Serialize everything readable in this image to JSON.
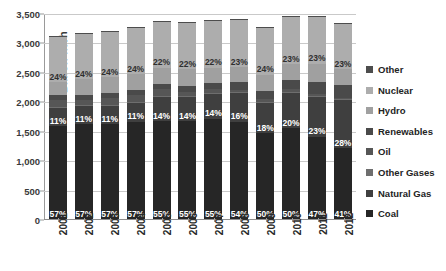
{
  "chart_data": {
    "type": "bar",
    "subtype": "stacked-bar",
    "title": "",
    "xlabel": "",
    "ylabel": "Billion kWh",
    "ylim": [
      0,
      3500
    ],
    "ytick_values": [
      0,
      500,
      1000,
      1500,
      2000,
      2500,
      3000,
      3500
    ],
    "ytick_labels": [
      "0",
      "500",
      "1,000",
      "1,500",
      "2,000",
      "2,500",
      "3,000",
      "3,500"
    ],
    "grid": true,
    "legend_position": "right",
    "categories": [
      "2001",
      "2002",
      "2003",
      "2004",
      "2005",
      "2006",
      "2007",
      "2008",
      "2009",
      "2010",
      "2011",
      "2012"
    ],
    "series": [
      {
        "name": "Coal",
        "color": "#262626",
        "values": [
          1580,
          1610,
          1610,
          1650,
          1660,
          1660,
          1700,
          1650,
          1460,
          1540,
          1400,
          1200
        ],
        "labels": [
          "57%",
          "57%",
          "57%",
          "57%",
          "55%",
          "55%",
          "55%",
          "54%",
          "50%",
          "50%",
          "47%",
          "41%"
        ]
      },
      {
        "name": "Natural Gas",
        "color": "#3f3f3f",
        "values": [
          305,
          310,
          310,
          320,
          420,
          425,
          435,
          490,
          525,
          615,
          685,
          820
        ],
        "labels": [
          "11%",
          "11%",
          "11%",
          "11%",
          "14%",
          "14%",
          "14%",
          "16%",
          "18%",
          "20%",
          "23%",
          "28%"
        ]
      },
      {
        "name": "Other Gases",
        "color": "#6e6e6e",
        "values": [
          16,
          16,
          16,
          16,
          14,
          14,
          14,
          12,
          11,
          11,
          11,
          11
        ],
        "labels": [
          "",
          "",
          "",
          "",
          "",
          "",
          "",
          "",
          "",
          "",
          "",
          ""
        ]
      },
      {
        "name": "Oil",
        "color": "#565656",
        "values": [
          125,
          95,
          120,
          120,
          122,
          64,
          65,
          46,
          38,
          37,
          30,
          23
        ],
        "labels": [
          "",
          "",
          "",
          "",
          "",
          "",
          "",
          "",
          "",
          "",
          "",
          ""
        ]
      },
      {
        "name": "Renewables",
        "color": "#4a4a4a",
        "values": [
          80,
          79,
          79,
          83,
          87,
          96,
          105,
          126,
          144,
          167,
          195,
          219
        ],
        "labels": [
          "",
          "",
          "",
          "",
          "",
          "",
          "",
          "",
          "",
          "",
          "",
          ""
        ]
      },
      {
        "name": "Hydro",
        "color": "#a0a0a0",
        "values": [
          217,
          264,
          276,
          268,
          270,
          289,
          248,
          255,
          273,
          260,
          319,
          276
        ],
        "labels": [
          "",
          "",
          "",
          "",
          "",
          "",
          "",
          "",
          "",
          "",
          "",
          ""
        ]
      },
      {
        "name": "Nuclear",
        "color": "#adadad",
        "values": [
          769,
          780,
          764,
          789,
          782,
          787,
          806,
          806,
          799,
          807,
          790,
          769
        ],
        "labels": [
          "24%",
          "24%",
          "24%",
          "24%",
          "22%",
          "22%",
          "22%",
          "23%",
          "24%",
          "23%",
          "23%",
          "23%"
        ]
      },
      {
        "name": "Other",
        "color": "#4d4d4d",
        "values": [
          12,
          12,
          12,
          12,
          12,
          12,
          12,
          12,
          12,
          12,
          12,
          12
        ],
        "labels": [
          "",
          "",
          "",
          "",
          "",
          "",
          "",
          "",
          "",
          "",
          "",
          ""
        ]
      }
    ],
    "totals": [
      2770,
      2870,
      2870,
      2940,
      3000,
      3000,
      3110,
      3050,
      2930,
      3010,
      3000,
      2940
    ]
  },
  "legend": {
    "items": [
      {
        "label": "Other",
        "color": "#4d4d4d"
      },
      {
        "label": "Nuclear",
        "color": "#adadad"
      },
      {
        "label": "Hydro",
        "color": "#a0a0a0"
      },
      {
        "label": "Renewables",
        "color": "#4a4a4a"
      },
      {
        "label": "Oil",
        "color": "#565656"
      },
      {
        "label": "Other Gases",
        "color": "#6e6e6e"
      },
      {
        "label": "Natural Gas",
        "color": "#3f3f3f"
      },
      {
        "label": "Coal",
        "color": "#262626"
      }
    ]
  },
  "axis": {
    "y_title": "Billion kWh"
  }
}
